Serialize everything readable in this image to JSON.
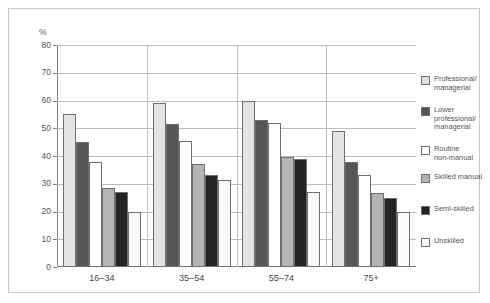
{
  "chart_data": {
    "type": "bar",
    "title": "",
    "subtitle": "",
    "xlabel": "",
    "ylabel": "%",
    "ylim": [
      0,
      80
    ],
    "ytick_step": 10,
    "yticks": [
      "0",
      "10",
      "20",
      "30",
      "40",
      "50",
      "60",
      "70",
      "80"
    ],
    "grid": true,
    "legend_position": "right",
    "categories": [
      "16–34",
      "35–54",
      "55–74",
      "75+"
    ],
    "series": [
      {
        "name": "Professional/\nmanagerial",
        "color": "#e3e3e3",
        "values": [
          55,
          59,
          60,
          49
        ]
      },
      {
        "name": "Lower\nprofessional/\nmanagerial",
        "color": "#565656",
        "values": [
          45,
          51.5,
          53,
          38
        ]
      },
      {
        "name": "Routine\nnon-manual",
        "color": "#ffffff",
        "values": [
          38,
          45.5,
          52,
          33
        ]
      },
      {
        "name": "Skilled manual",
        "color": "#b4b4b4",
        "values": [
          28.5,
          37,
          39.5,
          26.5
        ]
      },
      {
        "name": "Semi-skilled",
        "color": "#232323",
        "values": [
          27,
          33,
          39,
          25
        ]
      },
      {
        "name": "Unskilled",
        "color": "#fbfbfb",
        "values": [
          20,
          31.5,
          27,
          20
        ]
      }
    ]
  },
  "legend": {
    "items": [
      {
        "label": "Professional/\nmanagerial",
        "color": "#e3e3e3"
      },
      {
        "label": "Lower\nprofessional/\nmanagerial",
        "color": "#565656"
      },
      {
        "label": "Routine\nnon-manual",
        "color": "#ffffff"
      },
      {
        "label": "Skilled manual",
        "color": "#b4b4b4"
      },
      {
        "label": "Semi-skilled",
        "color": "#232323"
      },
      {
        "label": "Unskilled",
        "color": "#fbfbfb"
      }
    ]
  }
}
